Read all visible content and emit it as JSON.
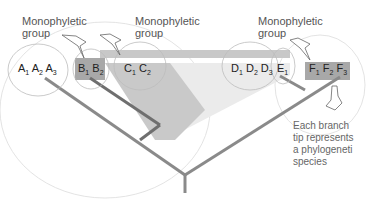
{
  "labels": {
    "group_left": [
      "Monophyletic",
      "group"
    ],
    "group_middle": [
      "Monophyletic",
      "group"
    ],
    "group_right": [
      "Monophyletic",
      "group"
    ],
    "note": [
      "Each branch",
      "tip represents",
      "a phylogeneti",
      "species"
    ]
  },
  "tips": [
    {
      "letter": "A",
      "subs": [
        "1",
        "2",
        "3"
      ]
    },
    {
      "letter": "B",
      "subs": [
        "1",
        "2"
      ]
    },
    {
      "letter": "C",
      "subs": [
        "1",
        "2"
      ]
    },
    {
      "letter": "D",
      "subs": [
        "1",
        "2",
        "3"
      ]
    },
    {
      "letter": "E",
      "subs": [
        "1"
      ]
    },
    {
      "letter": "F",
      "subs": [
        "1",
        "2",
        "3"
      ]
    }
  ],
  "colors": {
    "branch": "#8a8a8a",
    "branch_dark": "#6f6f6f",
    "highlight_dark": "#a9a9a9",
    "highlight_mid": "#c8c8c8",
    "highlight_light": "#e6e6e6",
    "circle": "#bdbdbd",
    "text": "#333333"
  }
}
